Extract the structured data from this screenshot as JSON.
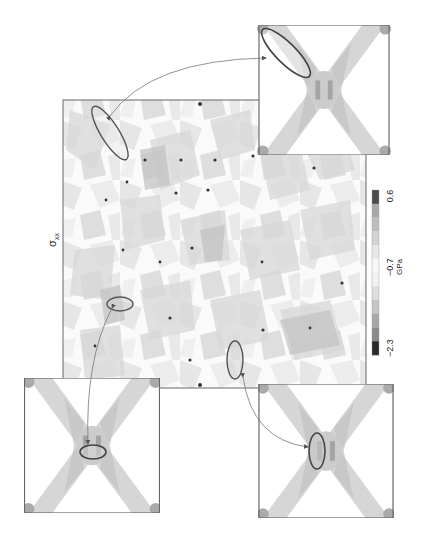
{
  "figure": {
    "title_symbol": "σ",
    "title_subscript": "xx",
    "orientation": "rotated 90° counter-clockwise",
    "main_panel": {
      "description": "stress field map with grain-boundary junction concentrations"
    },
    "colorbar": {
      "unit": "GPa",
      "min_label": "−2.3",
      "mid_label": "−0.7",
      "max_label": "0.6",
      "levels": [
        "#2a2a2a",
        "#8a8a8a",
        "#a8a8a8",
        "#c4c4c4",
        "#dedede",
        "#f2f2f2",
        "#f7f7f7",
        "#e8e8e8",
        "#d2d2d2",
        "#bdbdbd",
        "#a8a8a8",
        "#4a4a4a"
      ]
    },
    "insets": [
      {
        "id": "top-right",
        "label": "zoomed region 1",
        "ellipse": "elongated diagonal"
      },
      {
        "id": "bottom-left",
        "label": "zoomed region 2",
        "ellipse": "horizontal"
      },
      {
        "id": "bottom-right",
        "label": "zoomed region 3",
        "ellipse": "vertical"
      }
    ]
  }
}
